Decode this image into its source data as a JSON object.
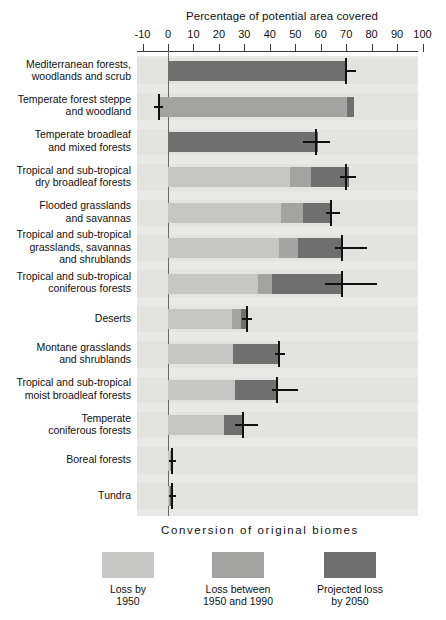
{
  "chart_data": {
    "type": "bar",
    "orientation": "horizontal",
    "stacked": true,
    "title": "Percentage of potential area covered",
    "xlabel": "Percentage of potential area covered",
    "ylabel": "",
    "xlim": [
      -10,
      100
    ],
    "xticks": [
      -10,
      0,
      10,
      20,
      30,
      40,
      50,
      60,
      70,
      80,
      90,
      100
    ],
    "xtick_labels": [
      "-10",
      "0",
      "10",
      "20",
      "30",
      "40",
      "50",
      "60",
      "70",
      "80",
      "90",
      "100"
    ],
    "grid": false,
    "legend_position": "bottom",
    "legend_title": "Conversion of original biomes",
    "series": [
      {
        "name": "Loss by 1950",
        "color": "#c6c6c4",
        "values": [
          70.0,
          -3.5,
          56.0,
          48.0,
          44.5,
          43.5,
          35.5,
          25.0,
          25.5,
          26.5,
          22.0,
          0.8,
          0.4
        ]
      },
      {
        "name": "Loss between 1950 and 1990",
        "color": "#a3a3a1",
        "values": [
          0.0,
          70.5,
          0.0,
          56.0,
          53.0,
          51.0,
          41.0,
          28.5,
          25.5,
          26.5,
          22.0,
          1.2,
          0.6
        ]
      },
      {
        "name": "Projected loss by 2050",
        "color": "#6f6f6f",
        "values": [
          70.0,
          73.0,
          59.0,
          71.0,
          64.0,
          68.5,
          68.5,
          30.5,
          43.5,
          43.0,
          29.5,
          1.6,
          1.4
        ]
      }
    ],
    "categories": [
      "Mediterranean forests, woodlands and scrub",
      "Temperate forest steppe and woodland",
      "Temperate broadleaf and mixed forests",
      "Tropical and sub-tropical dry broadleaf forests",
      "Flooded grasslands and savannas",
      "Tropical and sub-tropical grasslands, savannas and shrublands",
      "Tropical and sub-tropical coniferous forests",
      "Deserts",
      "Montane grasslands and shrublands",
      "Tropical and sub-tropical moist broadleaf forests",
      "Temperate coniferous forests",
      "Boreal forests",
      "Tundra"
    ],
    "markers": [
      {
        "value": 70.0,
        "span_start": 69.5,
        "span_end": 74.0
      },
      {
        "value": -3.5,
        "span_start": -5.5,
        "span_end": -2.0
      },
      {
        "value": 58.0,
        "span_start": 53.0,
        "span_end": 63.5
      },
      {
        "value": 70.0,
        "span_start": 67.5,
        "span_end": 74.0
      },
      {
        "value": 64.0,
        "span_start": 62.0,
        "span_end": 67.5
      },
      {
        "value": 68.5,
        "span_start": 65.5,
        "span_end": 78.0
      },
      {
        "value": 68.5,
        "span_start": 61.5,
        "span_end": 82.0
      },
      {
        "value": 31.0,
        "span_start": 29.0,
        "span_end": 33.0
      },
      {
        "value": 43.5,
        "span_start": 42.0,
        "span_end": 46.0
      },
      {
        "value": 43.0,
        "span_start": 41.0,
        "span_end": 51.0
      },
      {
        "value": 29.5,
        "span_start": 26.5,
        "span_end": 35.5
      },
      {
        "value": 1.6,
        "span_start": 0.5,
        "span_end": 3.0
      },
      {
        "value": 1.4,
        "span_start": 0.5,
        "span_end": 3.0
      }
    ]
  },
  "rows": [
    {
      "label_line1": "Mediterranean forests,",
      "label_line2": "woodlands and scrub",
      "label_line3": ""
    },
    {
      "label_line1": "Temperate forest steppe",
      "label_line2": "and woodland",
      "label_line3": ""
    },
    {
      "label_line1": "Temperate broadleaf",
      "label_line2": "and mixed forests",
      "label_line3": ""
    },
    {
      "label_line1": "Tropical and sub-tropical",
      "label_line2": "dry broadleaf forests",
      "label_line3": ""
    },
    {
      "label_line1": "Flooded grasslands",
      "label_line2": "and savannas",
      "label_line3": ""
    },
    {
      "label_line1": "Tropical and sub-tropical",
      "label_line2": "grasslands, savannas",
      "label_line3": "and shrublands"
    },
    {
      "label_line1": "Tropical and sub-tropical",
      "label_line2": "coniferous forests",
      "label_line3": ""
    },
    {
      "label_line1": "Deserts",
      "label_line2": "",
      "label_line3": ""
    },
    {
      "label_line1": "Montane grasslands",
      "label_line2": "and shrublands",
      "label_line3": ""
    },
    {
      "label_line1": "Tropical and sub-tropical",
      "label_line2": "moist broadleaf forests",
      "label_line3": ""
    },
    {
      "label_line1": "Temperate",
      "label_line2": "coniferous forests",
      "label_line3": ""
    },
    {
      "label_line1": "Boreal forests",
      "label_line2": "",
      "label_line3": ""
    },
    {
      "label_line1": "Tundra",
      "label_line2": "",
      "label_line3": ""
    }
  ],
  "legend": {
    "title": "Conversion of original biomes",
    "items": [
      {
        "line1": "Loss by",
        "line2": "1950",
        "color": "#c6c6c4"
      },
      {
        "line1": "Loss between",
        "line2": "1950 and 1990",
        "color": "#a3a3a1"
      },
      {
        "line1": "Projected loss",
        "line2": "by 2050",
        "color": "#6f6f6f"
      }
    ]
  },
  "colors": {
    "band_light": "#e9e9e7",
    "band_dark": "#e3e3e0",
    "axis": "#3a3a3a",
    "zero_line": "#6a6a6a",
    "marker": "#111111"
  }
}
